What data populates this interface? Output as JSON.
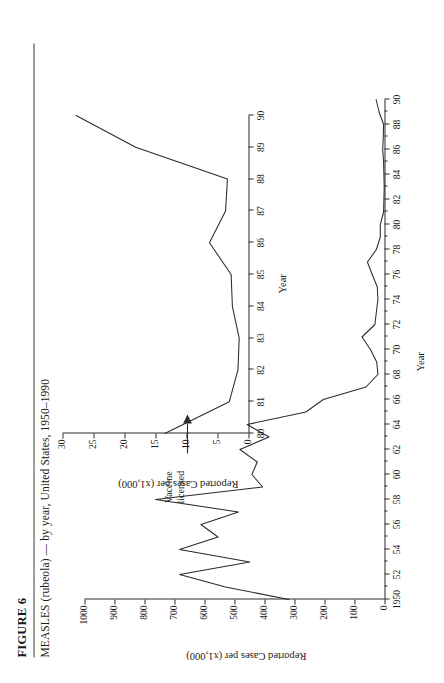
{
  "figure": {
    "number_label": "FIGURE 6",
    "subtitle": "MEASLES (rubeola) — by year, United States, 1950–1990"
  },
  "annotation": {
    "line1": "Vaccine",
    "line2": "licensed",
    "icon": "arrow-right-icon"
  },
  "chart_data": [
    {
      "id": "main",
      "type": "line",
      "title": "MEASLES (rubeola) — by year, United States, 1950–1990",
      "xlabel": "Year",
      "ylabel": "Reported Cases per  (x1,000)",
      "xlim": [
        1950,
        1990
      ],
      "ylim": [
        0,
        1000
      ],
      "ytick_step": 100,
      "grid": false,
      "legend": null,
      "ytick_labels": [
        "1000",
        "900",
        "800",
        "700",
        "600",
        "500",
        "400",
        "300",
        "200",
        "100",
        "0"
      ],
      "ytick_values": [
        1000,
        900,
        800,
        700,
        600,
        500,
        400,
        300,
        200,
        100,
        0
      ],
      "xtick_labels": [
        "1950",
        "52",
        "54",
        "56",
        "58",
        "60",
        "62",
        "64",
        "66",
        "68",
        "70",
        "72",
        "74",
        "76",
        "78",
        "80",
        "82",
        "84",
        "86",
        "88",
        "90"
      ],
      "xtick_values": [
        1950,
        1952,
        1954,
        1956,
        1958,
        1960,
        1962,
        1964,
        1966,
        1968,
        1970,
        1972,
        1974,
        1976,
        1978,
        1980,
        1982,
        1984,
        1986,
        1988,
        1990
      ],
      "x": [
        1950,
        1951,
        1952,
        1953,
        1954,
        1955,
        1956,
        1957,
        1958,
        1959,
        1960,
        1961,
        1962,
        1963,
        1964,
        1965,
        1966,
        1967,
        1968,
        1969,
        1970,
        1971,
        1972,
        1973,
        1974,
        1975,
        1976,
        1977,
        1978,
        1979,
        1980,
        1981,
        1982,
        1983,
        1984,
        1985,
        1986,
        1987,
        1988,
        1989,
        1990
      ],
      "values": [
        319,
        530,
        683,
        449,
        683,
        555,
        612,
        487,
        763,
        406,
        442,
        424,
        482,
        385,
        458,
        262,
        204,
        62,
        22,
        26,
        47,
        75,
        32,
        27,
        22,
        24,
        41,
        57,
        27,
        14,
        14,
        3,
        2,
        1,
        2,
        3,
        6,
        4,
        3,
        18,
        28
      ],
      "annotations": [
        {
          "text": "Vaccine licensed",
          "x": 1963,
          "y": 385
        }
      ]
    },
    {
      "id": "inset",
      "type": "line",
      "title": null,
      "xlabel": "Year",
      "ylabel": "Reported Cases per  (x1,000)",
      "xlim": [
        1980,
        1990
      ],
      "ylim": [
        0,
        30
      ],
      "ytick_step": 5,
      "grid": false,
      "legend": null,
      "ytick_labels": [
        "30",
        "25",
        "20",
        "15",
        "10",
        "5",
        "0"
      ],
      "ytick_values": [
        30,
        25,
        20,
        15,
        10,
        5,
        0
      ],
      "xtick_labels": [
        "80",
        "81",
        "82",
        "83",
        "84",
        "85",
        "86",
        "87",
        "88",
        "89",
        "90"
      ],
      "xtick_values": [
        1980,
        1981,
        1982,
        1983,
        1984,
        1985,
        1986,
        1987,
        1988,
        1989,
        1990
      ],
      "x": [
        1980,
        1981,
        1982,
        1983,
        1984,
        1985,
        1986,
        1987,
        1988,
        1989,
        1990
      ],
      "values": [
        13.5,
        3.1,
        1.7,
        1.5,
        2.6,
        2.8,
        6.3,
        3.7,
        3.4,
        18.2,
        27.8
      ]
    }
  ]
}
